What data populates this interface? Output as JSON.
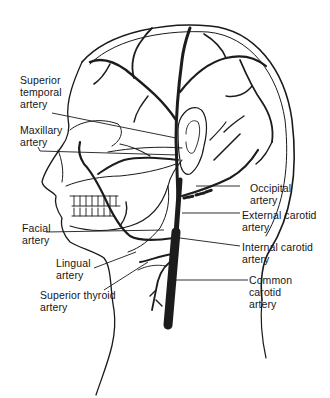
{
  "diagram": {
    "colors": {
      "line": "#1a1a1a",
      "artery": "#1c1c1c",
      "background": "#ffffff"
    },
    "labels": {
      "superior_temporal": "Superior\ntemporal\nartery",
      "maxillary": "Maxillary\nartery",
      "facial": "Facial\nartery",
      "lingual": "Lingual\nartery",
      "superior_thyroid": "Superior thyroid\nartery",
      "occipital": "Occipital\nartery",
      "external_carotid": "External carotid\nartery",
      "internal_carotid": "Internal carotid\nartery",
      "common_carotid": "Common\ncarotid\nartery"
    }
  }
}
